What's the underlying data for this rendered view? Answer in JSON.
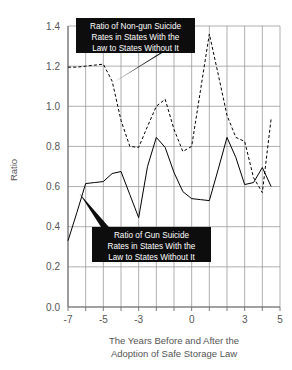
{
  "chart_data": {
    "type": "line",
    "title": "",
    "subtitle": "",
    "xlabel": "The Years Before and After the Adoption of Safe Storage Law",
    "xlabel_lines": [
      "The Years Before and After the",
      "Adoption of Safe Storage Law"
    ],
    "ylabel": "Ratio",
    "xlim": [
      -7,
      5
    ],
    "ylim": [
      0.0,
      1.4
    ],
    "x_ticks": [
      -7,
      -5,
      -3,
      0,
      3,
      5
    ],
    "x_tick_labels": [
      "-7",
      "-5",
      "-3",
      "0",
      "3",
      "5"
    ],
    "x_gridlines": [
      -7,
      -6,
      -5,
      -4,
      -3,
      -2,
      -1,
      0,
      1,
      2,
      3,
      4,
      5
    ],
    "y_ticks": [
      0.0,
      0.2,
      0.4,
      0.6,
      0.8,
      1.0,
      1.2,
      1.4
    ],
    "y_tick_labels": [
      "0.0",
      "0.2",
      "0.4",
      "0.6",
      "0.8",
      "1.0",
      "1.2",
      "1.4"
    ],
    "grid": true,
    "legend": "callouts",
    "legend_position": "in-plot-callouts",
    "x": [
      -7,
      -6.5,
      -6,
      -5.5,
      -5,
      -4.5,
      -4,
      -3.5,
      -3,
      -2.5,
      -2,
      -1.5,
      -1,
      -0.5,
      0,
      0.5,
      1,
      1.5,
      2,
      2.5,
      3,
      3.5,
      4,
      4.5
    ],
    "series": [
      {
        "name": "Ratio of Gun Suicide Rates in States With the Law to States Without It",
        "style": "solid",
        "color": "#000000",
        "values": [
          0.33,
          0.47,
          0.615,
          0.62,
          0.625,
          0.665,
          0.675,
          0.56,
          0.445,
          0.7,
          0.845,
          0.795,
          0.67,
          0.575,
          0.54,
          0.535,
          0.53,
          0.685,
          0.845,
          0.745,
          0.61,
          0.62,
          0.695,
          0.6
        ]
      },
      {
        "name": "Ratio of Non-gun Suicide Rates in States With the Law to States Without It",
        "style": "dashed",
        "color": "#000000",
        "values": [
          1.195,
          1.195,
          1.2,
          1.205,
          1.21,
          1.125,
          0.93,
          0.8,
          0.795,
          0.9,
          1.0,
          1.035,
          0.885,
          0.775,
          0.8,
          1.08,
          1.36,
          1.16,
          0.955,
          0.845,
          0.825,
          0.645,
          0.57,
          0.94
        ]
      }
    ],
    "annotations": [
      {
        "id": "non-gun-callout",
        "lines": [
          "Ratio of Non-gun Suicide",
          "Rates in States With the",
          "Law to States Without It"
        ],
        "target_x": -4.4,
        "target_y": 1.12
      },
      {
        "id": "gun-callout",
        "lines": [
          "Ratio of Gun Suicide",
          "Rates in States With the",
          "Law to States Without It"
        ],
        "target_x": -6.35,
        "target_y": 0.565
      }
    ]
  },
  "colors": {
    "background": "#ffffff",
    "grid": "#8c8c8c",
    "axis": "#6e6e6e",
    "text": "#555555",
    "callout_bg": "#0d0d0d",
    "callout_text": "#ffffff",
    "series_line": "#000000"
  }
}
